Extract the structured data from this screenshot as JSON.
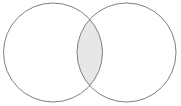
{
  "figure": {
    "name": "two-set-venn-diagram",
    "type": "venn",
    "width": 181,
    "height": 106,
    "background_color": "#ffffff",
    "stroke_color": "#808080",
    "stroke_width": 1,
    "highlight_region": "intersection",
    "highlight_fill": "#e7e7e5",
    "circle_fill": "#ffffff",
    "labels": {
      "left_circle": "",
      "right_circle": "",
      "intersection": "",
      "caption": ""
    },
    "sets": [
      {
        "id": "left-set",
        "name": "left-circle",
        "cx": 53,
        "cy": 52.5,
        "r": 49.5,
        "fill": "#ffffff",
        "shaded": false
      },
      {
        "id": "right-set",
        "name": "right-circle",
        "cx": 126.5,
        "cy": 52.5,
        "r": 49.5,
        "fill": "#ffffff",
        "shaded": false
      }
    ],
    "intersection": {
      "id": "intersection-region",
      "name": "intersection-lens",
      "shaded": true,
      "fill": "#e7e7e5",
      "left_x": 77,
      "right_x": 102.5,
      "top_y": 19,
      "bottom_y": 86,
      "center_x": 90,
      "center_y": 52.5
    }
  }
}
